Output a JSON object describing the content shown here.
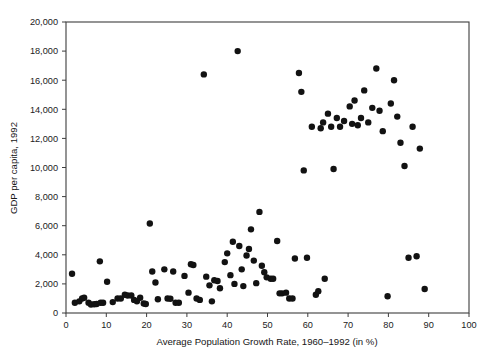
{
  "chart_data": {
    "type": "scatter",
    "title": "",
    "xlabel": "Average Population Growth Rate, 1960–1992 (in %)",
    "ylabel": "GDP per capita, 1992",
    "xlim": [
      0,
      100
    ],
    "ylim": [
      0,
      20000
    ],
    "grid": false,
    "legend": "none",
    "xticks": [
      0,
      10,
      20,
      30,
      40,
      50,
      60,
      70,
      80,
      90,
      100
    ],
    "xtick_labels": [
      "0",
      "10",
      "20",
      "30",
      "40",
      "50",
      "60",
      "70",
      "80",
      "90",
      "100"
    ],
    "yticks": [
      0,
      2000,
      4000,
      6000,
      8000,
      10000,
      12000,
      14000,
      16000,
      18000,
      20000
    ],
    "ytick_labels": [
      "0",
      "2,000",
      "4,000",
      "6,000",
      "8,000",
      "10,000",
      "12,000",
      "14,000",
      "16,000",
      "18,000",
      "20,000"
    ],
    "marker": "filled-circle",
    "marker_color": "#121212",
    "marker_size": 3.2,
    "points": [
      [
        1.5,
        2700
      ],
      [
        2.2,
        700
      ],
      [
        3.3,
        800
      ],
      [
        4.0,
        1000
      ],
      [
        4.5,
        1050
      ],
      [
        5.6,
        700
      ],
      [
        6.2,
        580
      ],
      [
        7.0,
        600
      ],
      [
        7.6,
        620
      ],
      [
        8.4,
        3550
      ],
      [
        8.6,
        700
      ],
      [
        9.2,
        700
      ],
      [
        10.2,
        2150
      ],
      [
        11.6,
        750
      ],
      [
        12.8,
        1000
      ],
      [
        13.6,
        1000
      ],
      [
        14.6,
        1250
      ],
      [
        15.3,
        1200
      ],
      [
        16.2,
        1200
      ],
      [
        16.9,
        900
      ],
      [
        17.6,
        800
      ],
      [
        18.4,
        1050
      ],
      [
        19.3,
        650
      ],
      [
        19.8,
        620
      ],
      [
        20.8,
        6150
      ],
      [
        21.4,
        2850
      ],
      [
        22.2,
        2100
      ],
      [
        22.8,
        950
      ],
      [
        24.4,
        3000
      ],
      [
        25.2,
        1000
      ],
      [
        25.9,
        980
      ],
      [
        26.6,
        2850
      ],
      [
        27.2,
        700
      ],
      [
        28.0,
        700
      ],
      [
        29.4,
        2550
      ],
      [
        30.4,
        1400
      ],
      [
        31.0,
        3350
      ],
      [
        31.6,
        3300
      ],
      [
        32.4,
        1000
      ],
      [
        33.2,
        900
      ],
      [
        34.2,
        16400
      ],
      [
        34.8,
        2500
      ],
      [
        35.6,
        1900
      ],
      [
        36.2,
        800
      ],
      [
        36.8,
        2250
      ],
      [
        37.6,
        2200
      ],
      [
        38.2,
        1700
      ],
      [
        39.4,
        3500
      ],
      [
        40.0,
        4100
      ],
      [
        40.8,
        2600
      ],
      [
        41.4,
        4900
      ],
      [
        41.8,
        2000
      ],
      [
        42.6,
        18000
      ],
      [
        43.0,
        4600
      ],
      [
        43.6,
        3000
      ],
      [
        44.0,
        1850
      ],
      [
        44.8,
        3950
      ],
      [
        45.4,
        4400
      ],
      [
        45.9,
        5750
      ],
      [
        46.6,
        3600
      ],
      [
        47.2,
        2050
      ],
      [
        48.0,
        6950
      ],
      [
        48.6,
        3250
      ],
      [
        49.2,
        2800
      ],
      [
        49.8,
        2450
      ],
      [
        50.8,
        2350
      ],
      [
        51.4,
        2350
      ],
      [
        52.4,
        4950
      ],
      [
        53.0,
        1350
      ],
      [
        53.6,
        1350
      ],
      [
        54.6,
        1400
      ],
      [
        55.4,
        1000
      ],
      [
        56.2,
        1000
      ],
      [
        56.8,
        3750
      ],
      [
        57.8,
        16500
      ],
      [
        58.4,
        15200
      ],
      [
        59.0,
        9800
      ],
      [
        59.8,
        3800
      ],
      [
        61.0,
        12800
      ],
      [
        62.0,
        1250
      ],
      [
        62.6,
        1500
      ],
      [
        63.2,
        12700
      ],
      [
        63.8,
        13100
      ],
      [
        64.2,
        2350
      ],
      [
        65.0,
        13700
      ],
      [
        65.8,
        12800
      ],
      [
        66.4,
        9900
      ],
      [
        67.2,
        13400
      ],
      [
        68.0,
        12800
      ],
      [
        69.0,
        13200
      ],
      [
        70.4,
        14200
      ],
      [
        71.0,
        13000
      ],
      [
        71.6,
        14600
      ],
      [
        72.4,
        12900
      ],
      [
        73.2,
        13400
      ],
      [
        74.0,
        15300
      ],
      [
        75.0,
        13100
      ],
      [
        76.0,
        14100
      ],
      [
        77.0,
        16800
      ],
      [
        77.8,
        13900
      ],
      [
        78.6,
        12500
      ],
      [
        79.8,
        1150
      ],
      [
        80.6,
        14400
      ],
      [
        81.4,
        16000
      ],
      [
        82.2,
        13500
      ],
      [
        83.0,
        11700
      ],
      [
        84.0,
        10100
      ],
      [
        85.0,
        3800
      ],
      [
        86.0,
        12800
      ],
      [
        87.0,
        3900
      ],
      [
        87.8,
        11300
      ],
      [
        89.0,
        1650
      ]
    ]
  }
}
